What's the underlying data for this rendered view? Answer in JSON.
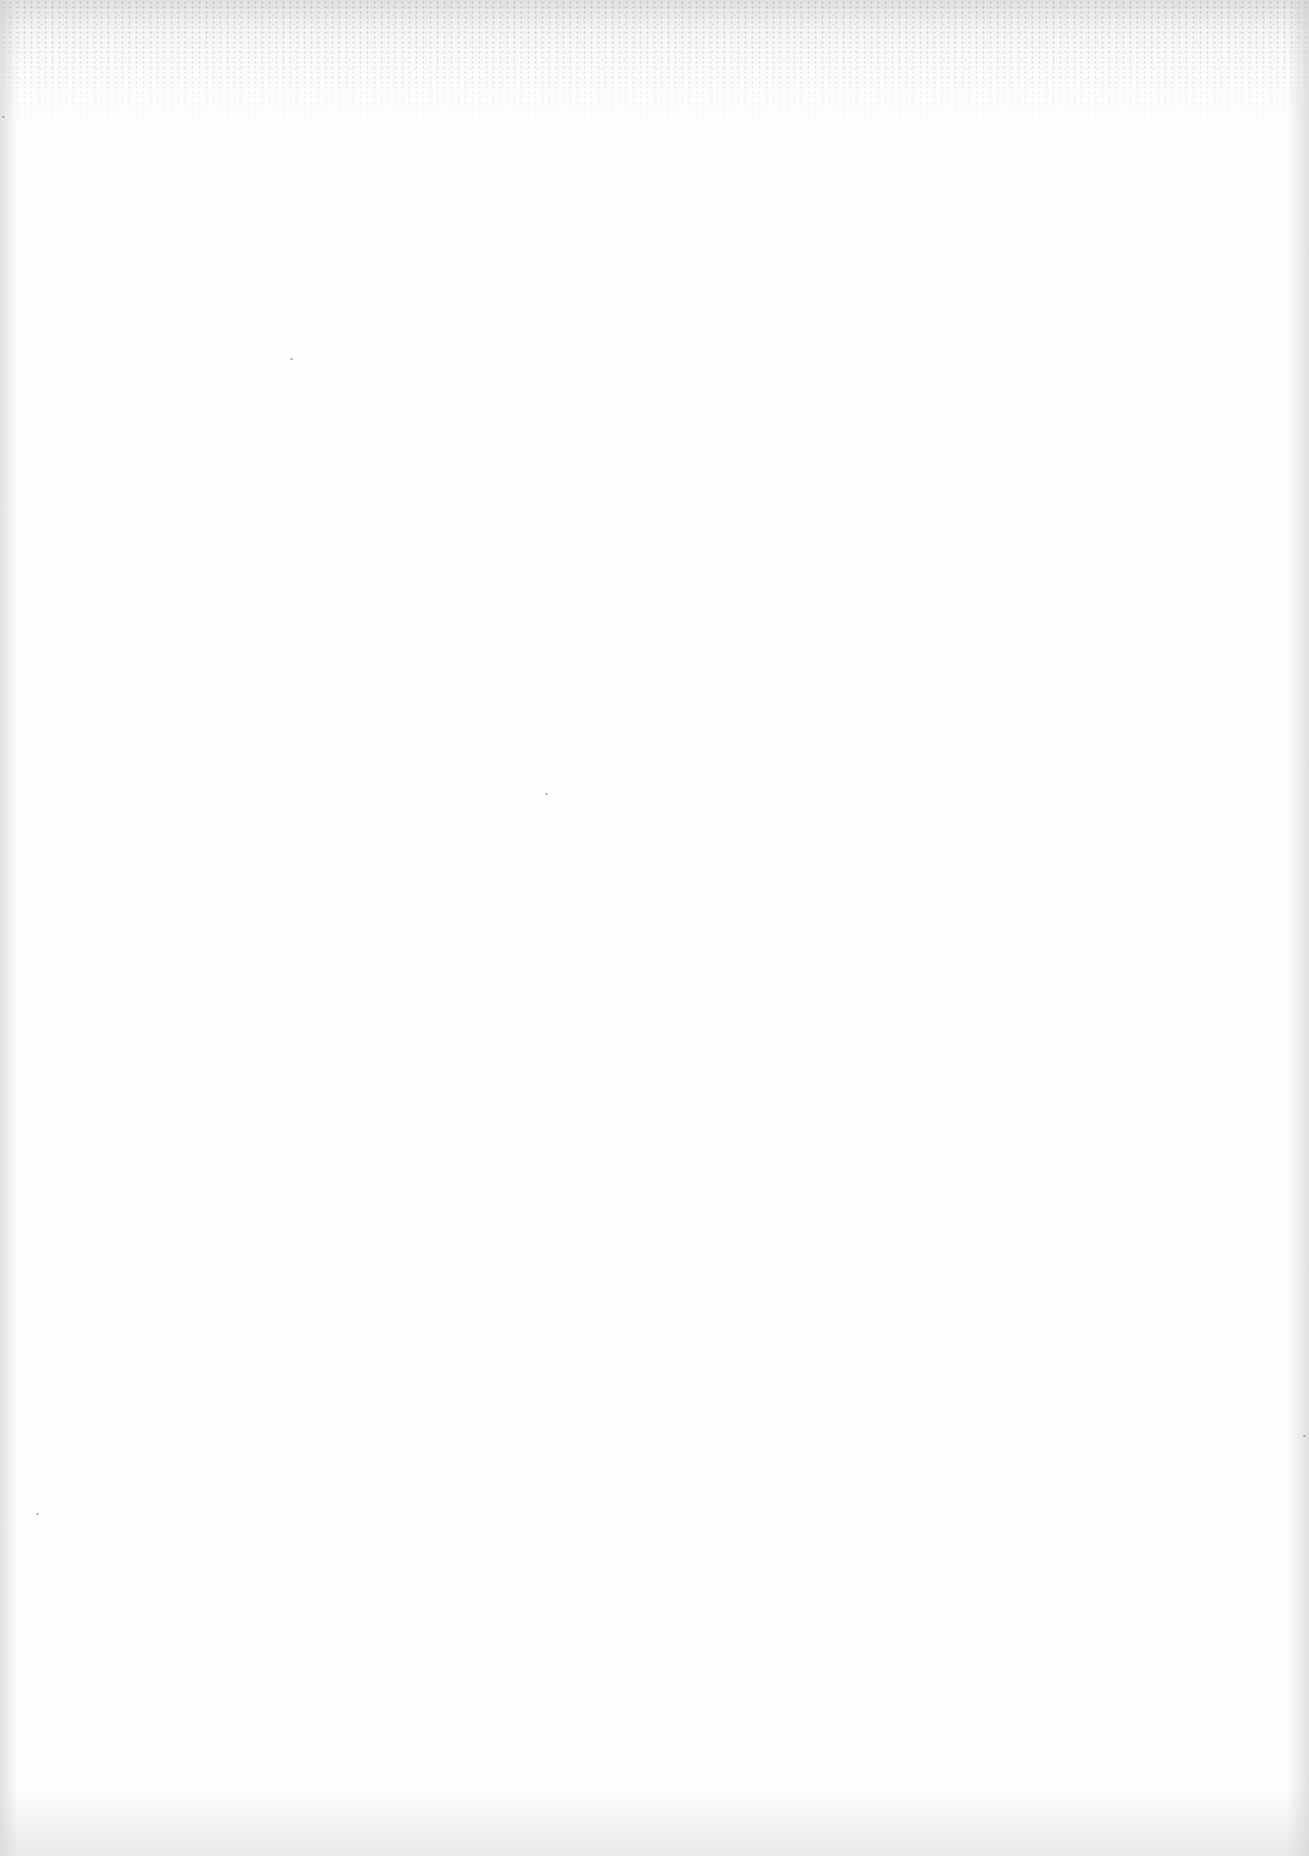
{
  "page": {
    "content": "",
    "colors": {
      "paper": "#fefefe",
      "scan_band": "#c8c8c8",
      "speck": "#9a9a9a"
    }
  }
}
